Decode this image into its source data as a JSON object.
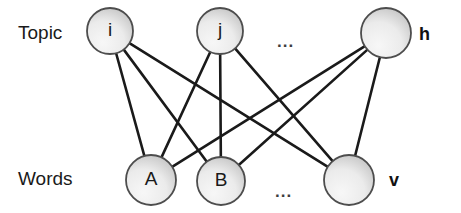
{
  "diagram": {
    "type": "bipartite-graph",
    "background_color": "#ffffff",
    "node_fill_light": "#f2f2f2",
    "node_fill_dark": "#b8b8b8",
    "node_stroke_color": "#4d4d4d",
    "edge_color": "#1a1a1a",
    "text_color": "#1a1a1a"
  },
  "rows": {
    "topic": {
      "label": "Topic",
      "side_label": "h",
      "ellipsis": "...",
      "nodes": [
        {
          "id": "i",
          "label": "i",
          "cx": 110,
          "cy": 31,
          "r": 23
        },
        {
          "id": "j",
          "label": "j",
          "cx": 220,
          "cy": 31,
          "r": 23
        },
        {
          "id": "h",
          "label": "",
          "cx": 386,
          "cy": 33,
          "r": 25
        }
      ]
    },
    "words": {
      "label": "Words",
      "side_label": "v",
      "ellipsis": "...",
      "nodes": [
        {
          "id": "A",
          "label": "A",
          "cx": 151,
          "cy": 180,
          "r": 25
        },
        {
          "id": "B",
          "label": "B",
          "cx": 221,
          "cy": 181,
          "r": 24
        },
        {
          "id": "v",
          "label": "",
          "cx": 349,
          "cy": 180,
          "r": 25
        }
      ]
    }
  },
  "edges": [
    {
      "from": "i",
      "to": "A"
    },
    {
      "from": "i",
      "to": "B"
    },
    {
      "from": "i",
      "to": "v"
    },
    {
      "from": "j",
      "to": "A"
    },
    {
      "from": "j",
      "to": "B"
    },
    {
      "from": "j",
      "to": "v"
    },
    {
      "from": "h",
      "to": "A"
    },
    {
      "from": "h",
      "to": "B"
    },
    {
      "from": "h",
      "to": "v"
    }
  ]
}
